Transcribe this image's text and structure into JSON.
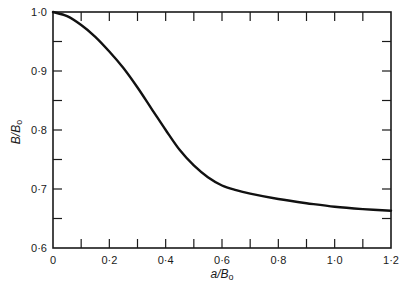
{
  "chart_data": {
    "type": "line",
    "title": "",
    "xlabel": "a/B₀",
    "ylabel": "B/B₀",
    "xlim": [
      0,
      1.2
    ],
    "ylim": [
      0.6,
      1.0
    ],
    "grid": false,
    "legend": null,
    "x_ticks_major": [
      0,
      0.2,
      0.4,
      0.6,
      0.8,
      1.0,
      1.2
    ],
    "x_tick_labels": [
      "0",
      "0·2",
      "0·4",
      "0·6",
      "0·8",
      "1·0",
      "1·2"
    ],
    "x_ticks_minor": [
      0.1,
      0.3,
      0.5,
      0.7,
      0.9,
      1.1
    ],
    "y_ticks_major": [
      0.6,
      0.7,
      0.8,
      0.9,
      1.0
    ],
    "y_tick_labels": [
      "0·6",
      "0·7",
      "0·8",
      "0·9",
      "1·0"
    ],
    "y_ticks_minor": [
      0.65,
      0.75,
      0.85,
      0.95
    ],
    "series": [
      {
        "name": "B/B0",
        "x": [
          0,
          0.05,
          0.1,
          0.15,
          0.2,
          0.25,
          0.3,
          0.35,
          0.4,
          0.45,
          0.5,
          0.55,
          0.6,
          0.65,
          0.7,
          0.8,
          0.9,
          1.0,
          1.1,
          1.2
        ],
        "y": [
          1.0,
          0.993,
          0.978,
          0.958,
          0.933,
          0.905,
          0.872,
          0.836,
          0.8,
          0.766,
          0.74,
          0.72,
          0.706,
          0.698,
          0.692,
          0.683,
          0.676,
          0.67,
          0.666,
          0.663
        ]
      }
    ]
  },
  "axes": {
    "x_label_main": "a/B",
    "x_label_sub": "o",
    "y_label_main": "B/B",
    "y_label_sub": "o"
  }
}
